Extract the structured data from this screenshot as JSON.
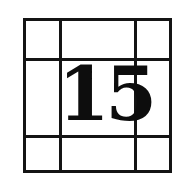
{
  "puzzle": {
    "number": "15",
    "grid": {
      "rows": 3,
      "cols": 3
    },
    "colors": {
      "line": "#141414",
      "text": "#0d0d0d",
      "background": "#ffffff"
    }
  }
}
